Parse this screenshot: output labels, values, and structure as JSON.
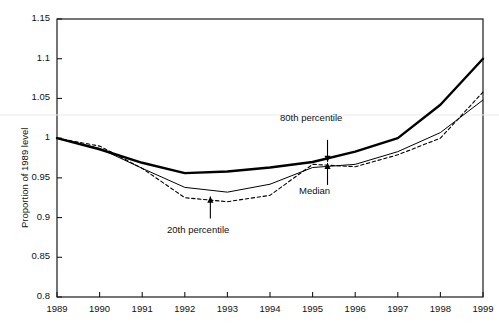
{
  "chart_data": {
    "type": "line",
    "title": "",
    "subtitle": "",
    "xlabel": "",
    "ylabel": "Proportion of 1989 level",
    "xlim": [
      1989,
      1999
    ],
    "ylim": [
      0.8,
      1.15
    ],
    "grid": false,
    "legend_position": "inline-annotations",
    "x": [
      1989,
      1990,
      1991,
      1992,
      1993,
      1994,
      1995,
      1996,
      1997,
      1998,
      1999
    ],
    "xticklabels": [
      "1989",
      "1990",
      "1991",
      "1992",
      "1993",
      "1994",
      "1995",
      "1996",
      "1997",
      "1998",
      "1999"
    ],
    "yticks": [
      0.8,
      0.85,
      0.9,
      0.95,
      1.0,
      1.05,
      1.1,
      1.15
    ],
    "yticklabels": [
      "0.8",
      "0.85",
      "0.9",
      "0.95",
      "1",
      "1.05",
      "1.1",
      "1.15"
    ],
    "reference_line_y": 1.036,
    "series": [
      {
        "name": "80th percentile",
        "style": "solid-thick",
        "values": [
          1.0,
          0.986,
          0.969,
          0.956,
          0.958,
          0.963,
          0.97,
          0.983,
          1.0,
          1.042,
          1.1
        ]
      },
      {
        "name": "Median",
        "style": "solid-thin",
        "values": [
          1.0,
          0.987,
          0.962,
          0.938,
          0.932,
          0.942,
          0.963,
          0.967,
          0.983,
          1.007,
          1.048
        ]
      },
      {
        "name": "20th percentile",
        "style": "dashed",
        "values": [
          1.0,
          0.99,
          0.962,
          0.925,
          0.92,
          0.928,
          0.967,
          0.964,
          0.979,
          1.0,
          1.058
        ]
      }
    ],
    "annotations": [
      {
        "text": "80th percentile",
        "arrow": "down",
        "points_to_series": "80th percentile",
        "points_to_x": 1995.35
      },
      {
        "text": "Median",
        "arrow": "up",
        "points_to_series": "Median",
        "points_to_x": 1995.35
      },
      {
        "text": "20th percentile",
        "arrow": "up",
        "points_to_series": "20th percentile",
        "points_to_x": 1992.6
      }
    ]
  },
  "axis": {
    "ylabel": "Proportion of 1989 level",
    "yticklabels": [
      "1.15",
      "1.1",
      "1.05",
      "1",
      "0.95",
      "0.9",
      "0.85",
      "0.8"
    ],
    "xticklabels": [
      "1989",
      "1990",
      "1991",
      "1992",
      "1993",
      "1994",
      "1995",
      "1996",
      "1997",
      "1998",
      "1999"
    ]
  },
  "annotations": {
    "p80": "80th percentile",
    "median": "Median",
    "p20": "20th percentile"
  },
  "colors": {
    "line": "#000000",
    "axis": "#1a1a1a",
    "reference_line": "#e8e8e8",
    "background": "#ffffff"
  }
}
